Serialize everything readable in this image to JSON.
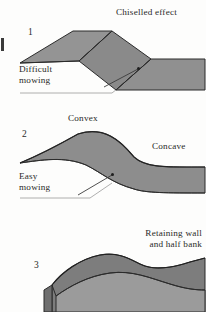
{
  "page": {
    "kind": "landscape-grading-diagram",
    "background_color": "#fdfdfc",
    "ink_color": "#2a2a28"
  },
  "palette": {
    "slope_fill": "#8e8e8e",
    "slope_fill_dark": "#7c7c7c",
    "slope_fill_light": "#9e9e9e",
    "outline": "#2b2b2b",
    "leader_line": "#4a4a4a",
    "ground_line": "#8a8a8a"
  },
  "figures": [
    {
      "number": "1",
      "title": "Chiselled effect",
      "callout": "Difficult\nmowing",
      "callout_line_1": "Difficult",
      "callout_line_2": "mowing",
      "description": "Faceted bank with sharp creased edges produced by machine grading"
    },
    {
      "number": "2",
      "title_left": "Convex",
      "title_right": "Concave",
      "callout": "Easy\nmowing",
      "callout_line_1": "Easy",
      "callout_line_2": "mowing",
      "description": "Smoothly rounded slope blending convex crest into concave toe"
    },
    {
      "number": "3",
      "title_line_1": "Retaining wall",
      "title_line_2": "and half bank",
      "description": "Bank cut by a vertical retaining wall on the left with a half bank behind"
    }
  ]
}
